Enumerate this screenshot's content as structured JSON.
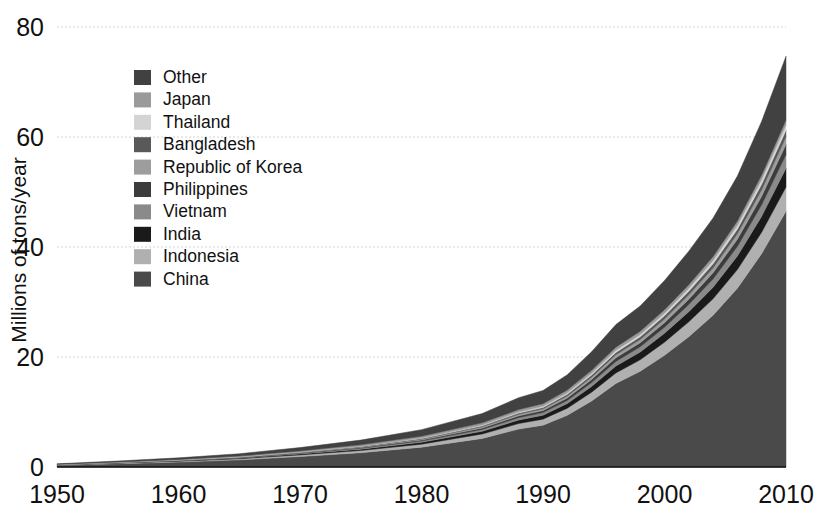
{
  "chart_data": {
    "type": "area",
    "title": "",
    "subtitle": "",
    "xlabel": "",
    "ylabel": "Millions of tons/year",
    "xlim": [
      1950,
      2010
    ],
    "ylim": [
      0,
      80
    ],
    "yticks": [
      0,
      20,
      40,
      60,
      80
    ],
    "xticks": [
      1950,
      1960,
      1970,
      1980,
      1990,
      2000,
      2010
    ],
    "ytick_labels": [
      "0",
      "20",
      "40",
      "60",
      "80"
    ],
    "xtick_labels": [
      "1950",
      "1960",
      "1970",
      "1980",
      "1990",
      "2000",
      "2010"
    ],
    "grid": true,
    "grid_style": "dotted-horizontal",
    "grid_color": "#e2e2e2",
    "stacked": true,
    "stack_order_bottom_to_top": [
      "China",
      "Indonesia",
      "India",
      "Vietnam",
      "Philippines",
      "Republic of Korea",
      "Bangladesh",
      "Thailand",
      "Japan",
      "Other"
    ],
    "legend_position": "upper-left-inside",
    "legend_order_top_to_bottom": [
      "Other",
      "Japan",
      "Thailand",
      "Bangladesh",
      "Republic of Korea",
      "Philippines",
      "Vietnam",
      "India",
      "Indonesia",
      "China"
    ],
    "x": [
      1950,
      1955,
      1960,
      1965,
      1970,
      1975,
      1980,
      1985,
      1988,
      1990,
      1992,
      1994,
      1996,
      1998,
      2000,
      2002,
      2004,
      2006,
      2008,
      2010
    ],
    "series": [
      {
        "name": "China",
        "color": "#4a4a4a",
        "values": [
          0.3,
          0.6,
          0.9,
          1.3,
          1.9,
          2.6,
          3.6,
          5.2,
          6.9,
          7.6,
          9.4,
          12.0,
          15.2,
          17.4,
          20.3,
          23.7,
          27.6,
          32.5,
          38.8,
          46.5
        ]
      },
      {
        "name": "Indonesia",
        "color": "#b0b0b0",
        "values": [
          0.05,
          0.1,
          0.15,
          0.2,
          0.3,
          0.4,
          0.55,
          0.8,
          1.0,
          1.1,
          1.3,
          1.6,
          1.9,
          2.1,
          2.4,
          2.7,
          3.0,
          3.4,
          3.9,
          4.4
        ]
      },
      {
        "name": "India",
        "color": "#1a1a1a",
        "values": [
          0.03,
          0.05,
          0.08,
          0.12,
          0.18,
          0.25,
          0.35,
          0.5,
          0.65,
          0.72,
          0.85,
          1.05,
          1.25,
          1.4,
          1.6,
          1.85,
          2.1,
          2.45,
          2.9,
          3.4
        ]
      },
      {
        "name": "Vietnam",
        "color": "#8a8a8a",
        "values": [
          0.02,
          0.03,
          0.05,
          0.07,
          0.1,
          0.15,
          0.22,
          0.32,
          0.42,
          0.47,
          0.56,
          0.7,
          0.85,
          0.95,
          1.1,
          1.3,
          1.5,
          1.75,
          2.1,
          2.5
        ]
      },
      {
        "name": "Philippines",
        "color": "#3c3c3c",
        "values": [
          0.02,
          0.03,
          0.04,
          0.06,
          0.09,
          0.13,
          0.18,
          0.26,
          0.33,
          0.37,
          0.44,
          0.54,
          0.65,
          0.73,
          0.84,
          0.97,
          1.12,
          1.3,
          1.55,
          1.85
        ]
      },
      {
        "name": "Republic of Korea",
        "color": "#9d9d9d",
        "values": [
          0.01,
          0.02,
          0.03,
          0.05,
          0.07,
          0.1,
          0.15,
          0.22,
          0.28,
          0.31,
          0.37,
          0.45,
          0.54,
          0.6,
          0.68,
          0.78,
          0.88,
          1.0,
          1.18,
          1.38
        ]
      },
      {
        "name": "Bangladesh",
        "color": "#595959",
        "values": [
          0.01,
          0.02,
          0.03,
          0.04,
          0.06,
          0.09,
          0.12,
          0.18,
          0.23,
          0.26,
          0.31,
          0.38,
          0.45,
          0.5,
          0.57,
          0.65,
          0.74,
          0.85,
          1.0,
          1.18
        ]
      },
      {
        "name": "Thailand",
        "color": "#d4d4d4",
        "values": [
          0.01,
          0.01,
          0.02,
          0.03,
          0.05,
          0.07,
          0.1,
          0.15,
          0.19,
          0.21,
          0.25,
          0.31,
          0.37,
          0.41,
          0.47,
          0.54,
          0.62,
          0.72,
          0.85,
          1.0
        ]
      },
      {
        "name": "Japan",
        "color": "#9a9a9a",
        "values": [
          0.03,
          0.05,
          0.08,
          0.12,
          0.18,
          0.25,
          0.32,
          0.4,
          0.45,
          0.47,
          0.5,
          0.54,
          0.58,
          0.6,
          0.63,
          0.66,
          0.7,
          0.74,
          0.8,
          0.88
        ]
      },
      {
        "name": "Other",
        "color": "#414141",
        "values": [
          0.1,
          0.18,
          0.28,
          0.42,
          0.6,
          0.85,
          1.2,
          1.7,
          2.15,
          2.4,
          2.8,
          3.4,
          4.1,
          4.6,
          5.3,
          6.1,
          7.0,
          8.2,
          9.8,
          11.6
        ]
      }
    ],
    "total_1950": 0.58,
    "total_2010": 74.69,
    "axis_color": "#111111",
    "background": "#ffffff"
  },
  "legend": {
    "items": [
      {
        "label": "Other",
        "color": "#414141"
      },
      {
        "label": "Japan",
        "color": "#9a9a9a"
      },
      {
        "label": "Thailand",
        "color": "#d4d4d4"
      },
      {
        "label": "Bangladesh",
        "color": "#595959"
      },
      {
        "label": "Republic of Korea",
        "color": "#9d9d9d"
      },
      {
        "label": "Philippines",
        "color": "#3c3c3c"
      },
      {
        "label": "Vietnam",
        "color": "#8a8a8a"
      },
      {
        "label": "India",
        "color": "#1a1a1a"
      },
      {
        "label": "Indonesia",
        "color": "#b0b0b0"
      },
      {
        "label": "China",
        "color": "#4a4a4a"
      }
    ]
  }
}
